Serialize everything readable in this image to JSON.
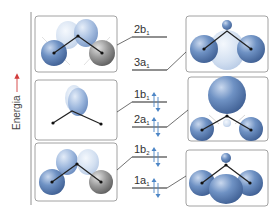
{
  "axis": {
    "label": "Energia",
    "arrow_color": "#d23c3c"
  },
  "colors": {
    "orbital_dark": "#5a7fb5",
    "orbital_light": "#b9cde8",
    "orbital_pale": "#dde7f4",
    "atom_gray": "#8a8a8a",
    "spin_arrow": "#4d86c6",
    "line": "#222222",
    "box_border": "#8c8c8c"
  },
  "levels": [
    {
      "id": "2b1",
      "main": "2b",
      "sub": "1",
      "occupied": false
    },
    {
      "id": "3a1",
      "main": "3a",
      "sub": "1",
      "occupied": false
    },
    {
      "id": "1b1",
      "main": "1b",
      "sub": "1",
      "occupied": true
    },
    {
      "id": "2a1",
      "main": "2a",
      "sub": "1",
      "occupied": true
    },
    {
      "id": "1b2",
      "main": "1b",
      "sub": "2",
      "occupied": true
    },
    {
      "id": "1a1",
      "main": "1a",
      "sub": "1",
      "occupied": true
    }
  ],
  "left_panels": [
    {
      "name": "orbital-2b1-antibonding",
      "type": "b-antibonding"
    },
    {
      "name": "orbital-1b1-nonbonding",
      "type": "p-lone"
    },
    {
      "name": "orbital-1b2-bonding",
      "type": "b-bonding"
    }
  ],
  "right_panels": [
    {
      "name": "orbital-3a1-antibonding",
      "type": "a-antibonding"
    },
    {
      "name": "orbital-2a1-lonepair",
      "type": "a-lone"
    },
    {
      "name": "orbital-1a1-bonding",
      "type": "a-bonding"
    }
  ]
}
